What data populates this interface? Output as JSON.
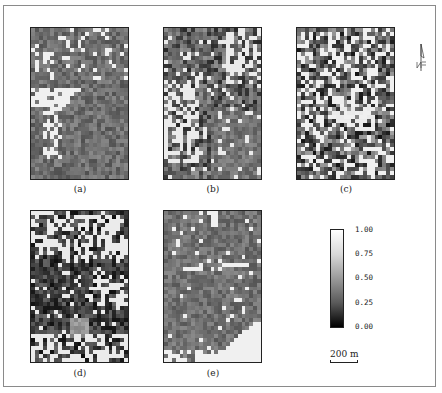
{
  "figure": {
    "panels": [
      {
        "id": "a",
        "label": "(a)",
        "description": "grid map, mostly mid-gray with white band across middle-left"
      },
      {
        "id": "b",
        "label": "(b)",
        "description": "grid map, mixed white patches on left and top-right"
      },
      {
        "id": "c",
        "label": "(c)",
        "description": "grid map, highly mixed dark/white checkered pattern"
      },
      {
        "id": "d",
        "label": "(d)",
        "description": "grid map, dark background with white patches top and bottom"
      },
      {
        "id": "e",
        "label": "(e)",
        "description": "grid map, mid-gray with large white patch at bottom-right"
      }
    ],
    "colorbar": {
      "ticks": [
        "1.00",
        "0.75",
        "0.50",
        "0.25",
        "0.00"
      ],
      "colors": {
        "top": "#ffffff",
        "bottom": "#000000"
      }
    },
    "scale_bar": {
      "label": "200 m"
    },
    "north_arrow": {
      "label": "N"
    }
  }
}
